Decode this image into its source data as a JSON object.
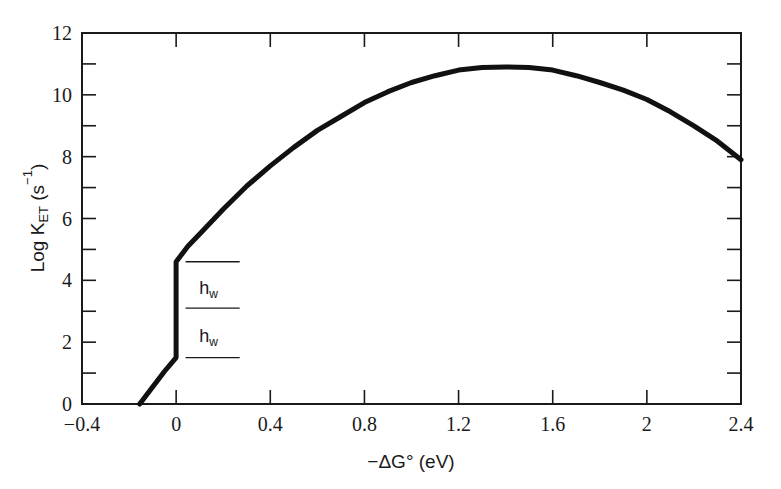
{
  "chart_data": {
    "type": "line",
    "title": "",
    "xlabel": "−ΔG° (eV)",
    "ylabel": "Log K_ET (s⁻¹)",
    "xlim": [
      -0.4,
      2.4
    ],
    "ylim": [
      0,
      12
    ],
    "x_ticks": [
      "−0.4",
      "0",
      "0.4",
      "0.8",
      "1.2",
      "1.6",
      "2",
      "2.4"
    ],
    "x_tick_values": [
      -0.4,
      0,
      0.4,
      0.8,
      1.2,
      1.6,
      2.0,
      2.4
    ],
    "y_ticks": [
      "0",
      "2",
      "4",
      "6",
      "8",
      "10",
      "12"
    ],
    "y_tick_values": [
      0,
      2,
      4,
      6,
      8,
      10,
      12
    ],
    "grid": false,
    "legend": null,
    "series": [
      {
        "name": "Log K_ET",
        "x": [
          -0.155,
          -0.1,
          -0.05,
          0.0,
          0.0,
          0.05,
          0.1,
          0.2,
          0.3,
          0.4,
          0.5,
          0.6,
          0.7,
          0.8,
          0.9,
          1.0,
          1.1,
          1.2,
          1.3,
          1.4,
          1.5,
          1.6,
          1.7,
          1.8,
          1.9,
          2.0,
          2.1,
          2.2,
          2.3,
          2.4
        ],
        "values": [
          0.0,
          0.55,
          1.05,
          1.5,
          4.6,
          5.1,
          5.5,
          6.3,
          7.05,
          7.7,
          8.3,
          8.85,
          9.3,
          9.75,
          10.1,
          10.4,
          10.62,
          10.8,
          10.88,
          10.9,
          10.88,
          10.8,
          10.62,
          10.4,
          10.15,
          9.85,
          9.45,
          9.0,
          8.5,
          7.9
        ]
      }
    ],
    "annotations": [
      {
        "text": "h",
        "subscript": "w",
        "x_range": [
          0.04,
          0.27
        ],
        "y_lines": [
          4.6,
          3.1
        ],
        "label_y": 3.75
      },
      {
        "text": "h",
        "subscript": "w",
        "x_range": [
          0.04,
          0.27
        ],
        "y_lines": [
          3.1,
          1.5
        ],
        "label_y": 2.2
      }
    ]
  }
}
